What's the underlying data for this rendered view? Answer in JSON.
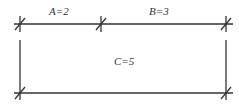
{
  "diagram": {
    "labels": {
      "a": "A=2",
      "b": "B=3",
      "c": "C=5"
    },
    "line_color": "#333333"
  }
}
